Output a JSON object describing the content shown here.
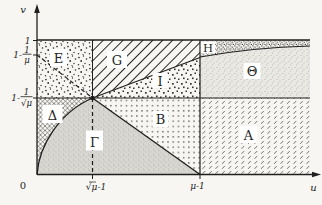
{
  "figure": {
    "axis": {
      "v": "v",
      "u": "u",
      "origin": "0"
    },
    "v_ticks": {
      "one": "1",
      "one_minus_inv_mu": {
        "pre": "1-",
        "num": "1",
        "den": "μ"
      },
      "one_minus_inv_sqrt_mu": {
        "pre": "1-",
        "num": "1",
        "den": "√μ"
      }
    },
    "u_ticks": {
      "sqrt_mu_minus_one": "√μ-1",
      "mu_minus_one": "μ-1"
    },
    "regions": {
      "E": "E",
      "G": "G",
      "H": "H",
      "I": "I",
      "theta": "Θ",
      "B": "B",
      "A": "A",
      "delta": "Δ",
      "gamma": "Γ"
    }
  },
  "colors": {
    "ink": "#1f1f1f",
    "paper": "#f7f6f2",
    "label_box": "#ffffff"
  }
}
